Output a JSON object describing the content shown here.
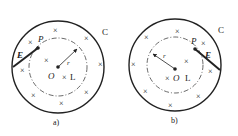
{
  "figures": [
    {
      "id": "a",
      "caption": "a)",
      "outer_circle_label": "C",
      "point_label": "P",
      "field_label": "E",
      "center_label": "O",
      "radius_label": "r",
      "loop_label": "L",
      "cross_symbol": "×",
      "field_direction": "inner circle point P on left, E arrow pointing down-left to outer circle"
    },
    {
      "id": "b",
      "caption": "b)",
      "outer_circle_label": "C",
      "point_label": "P",
      "field_label": "E",
      "center_label": "O",
      "radius_label": "r",
      "loop_label": "L",
      "cross_symbol": "×",
      "field_direction": "inner circle point P on right, E arrow pointing down-right to outer circle"
    }
  ],
  "colors": {
    "line": "#222222",
    "background": "#ffffff"
  }
}
